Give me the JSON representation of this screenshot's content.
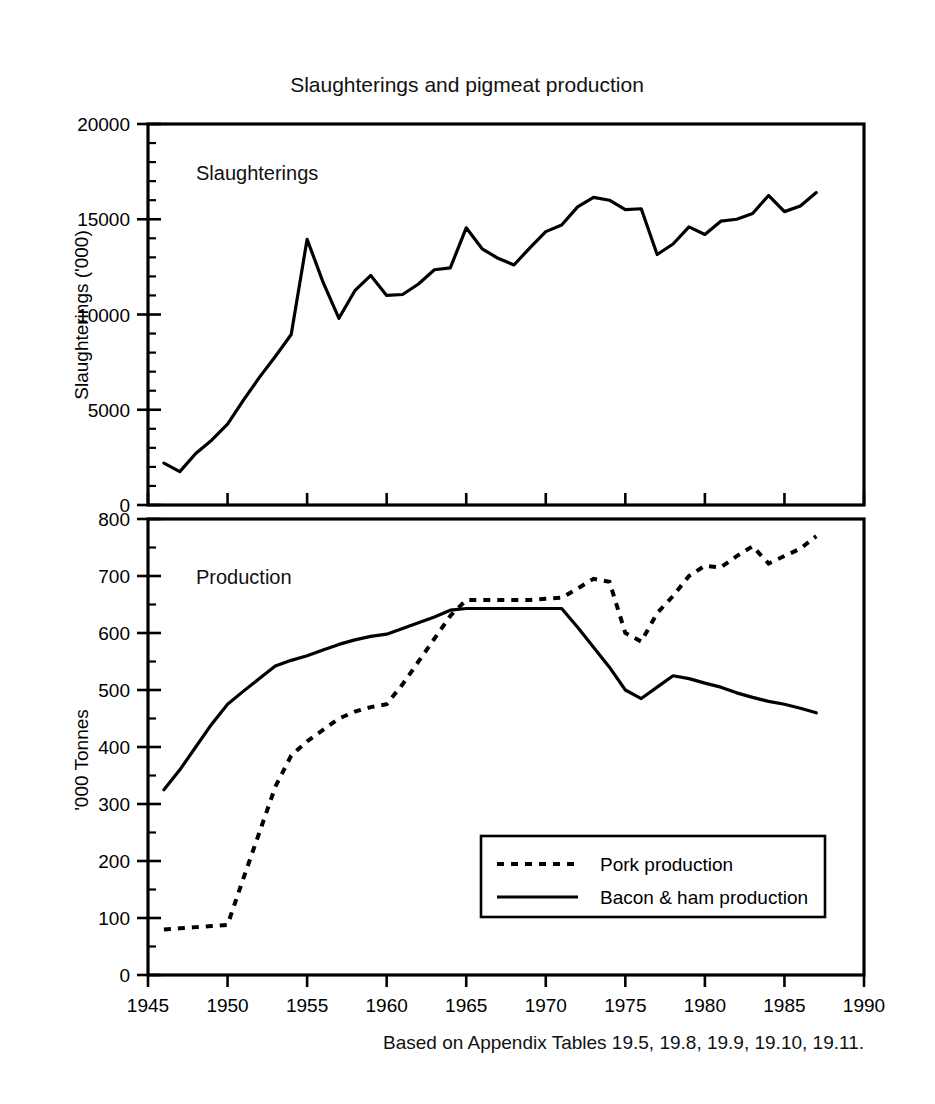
{
  "figure": {
    "title": "Slaughterings and pigmeat production",
    "footnote": "Based on Appendix Tables 19.5, 19.8, 19.9, 19.10, 19.11.",
    "background": "#ffffff",
    "ink": "#000000"
  },
  "axis": {
    "x_label": "",
    "x_ticks": [
      "1945",
      "1950",
      "1955",
      "1960",
      "1965",
      "1970",
      "1975",
      "1980",
      "1985",
      "1990"
    ],
    "x_tick_values": [
      1945,
      1950,
      1955,
      1960,
      1965,
      1970,
      1975,
      1980,
      1985,
      1990
    ],
    "xlim": [
      1945,
      1990
    ]
  },
  "panels": [
    {
      "key": "slaughterings",
      "label": "Slaughterings",
      "ylabel": "Slaughterings ('000)",
      "y_ticks": [
        "0",
        "5000",
        "10000",
        "15000",
        "20000"
      ],
      "y_tick_values": [
        0,
        5000,
        10000,
        15000,
        20000
      ],
      "ylim": [
        0,
        20000
      ],
      "minor_step": 1000
    },
    {
      "key": "production",
      "label": "Production",
      "ylabel": "'000 Tonnes",
      "y_ticks": [
        "0",
        "100",
        "200",
        "300",
        "400",
        "500",
        "600",
        "700",
        "800"
      ],
      "y_tick_values": [
        0,
        100,
        200,
        300,
        400,
        500,
        600,
        700,
        800
      ],
      "ylim": [
        0,
        800
      ],
      "minor_step": 50
    }
  ],
  "legend": {
    "position": "bottom-right-inside-production-panel",
    "entries": [
      {
        "label": "Pork production",
        "style": "dotted"
      },
      {
        "label": "Bacon & ham production",
        "style": "solid"
      }
    ]
  },
  "chart_data": [
    {
      "type": "line",
      "panel": "slaughterings",
      "title": "Slaughterings",
      "xlabel": "",
      "ylabel": "Slaughterings ('000)",
      "xlim": [
        1945,
        1990
      ],
      "ylim": [
        0,
        20000
      ],
      "grid": false,
      "series": [
        {
          "name": "Slaughterings",
          "style": "solid",
          "x": [
            1946,
            1947,
            1948,
            1949,
            1950,
            1951,
            1952,
            1953,
            1954,
            1955,
            1956,
            1957,
            1958,
            1959,
            1960,
            1961,
            1962,
            1963,
            1964,
            1965,
            1966,
            1967,
            1968,
            1969,
            1970,
            1971,
            1972,
            1973,
            1974,
            1975,
            1976,
            1977,
            1978,
            1979,
            1980,
            1981,
            1982,
            1983,
            1984,
            1985,
            1986,
            1987
          ],
          "values": [
            2200,
            1750,
            2700,
            3400,
            4250,
            5500,
            6700,
            7800,
            8950,
            13950,
            11700,
            9800,
            11250,
            12050,
            11000,
            11050,
            11600,
            12350,
            12450,
            14550,
            13450,
            12950,
            12600,
            13500,
            14350,
            14700,
            15650,
            16150,
            16000,
            15500,
            15550,
            13150,
            13700,
            14600,
            14200,
            14900,
            15000,
            15300,
            16250,
            15400,
            15700,
            16400
          ]
        }
      ]
    },
    {
      "type": "line",
      "panel": "production",
      "title": "Production",
      "xlabel": "",
      "ylabel": "'000 Tonnes",
      "xlim": [
        1945,
        1990
      ],
      "ylim": [
        0,
        800
      ],
      "grid": false,
      "series": [
        {
          "name": "Pork production",
          "style": "dotted",
          "x": [
            1946,
            1947,
            1948,
            1949,
            1950,
            1951,
            1952,
            1953,
            1954,
            1955,
            1956,
            1957,
            1958,
            1959,
            1960,
            1961,
            1962,
            1963,
            1964,
            1965,
            1966,
            1967,
            1968,
            1969,
            1970,
            1971,
            1972,
            1973,
            1974,
            1975,
            1976,
            1977,
            1978,
            1979,
            1980,
            1981,
            1982,
            1983,
            1984,
            1985,
            1986,
            1987
          ],
          "values": [
            80,
            82,
            84,
            86,
            88,
            170,
            250,
            330,
            385,
            410,
            430,
            450,
            462,
            470,
            475,
            510,
            550,
            590,
            630,
            658,
            658,
            658,
            658,
            658,
            660,
            662,
            678,
            695,
            690,
            600,
            585,
            635,
            665,
            700,
            718,
            715,
            735,
            752,
            722,
            735,
            748,
            770
          ]
        },
        {
          "name": "Bacon & ham production",
          "style": "solid",
          "x": [
            1946,
            1947,
            1948,
            1949,
            1950,
            1951,
            1952,
            1953,
            1954,
            1955,
            1956,
            1957,
            1958,
            1959,
            1960,
            1961,
            1962,
            1963,
            1964,
            1965,
            1966,
            1967,
            1968,
            1969,
            1970,
            1971,
            1972,
            1973,
            1974,
            1975,
            1976,
            1977,
            1978,
            1979,
            1980,
            1981,
            1982,
            1983,
            1984,
            1985,
            1986,
            1987
          ],
          "values": [
            325,
            360,
            400,
            440,
            475,
            498,
            520,
            542,
            552,
            560,
            570,
            580,
            588,
            594,
            598,
            608,
            618,
            628,
            640,
            643,
            643,
            643,
            643,
            643,
            643,
            643,
            610,
            575,
            540,
            500,
            485,
            505,
            525,
            520,
            512,
            505,
            495,
            487,
            480,
            475,
            468,
            460
          ]
        }
      ]
    }
  ]
}
